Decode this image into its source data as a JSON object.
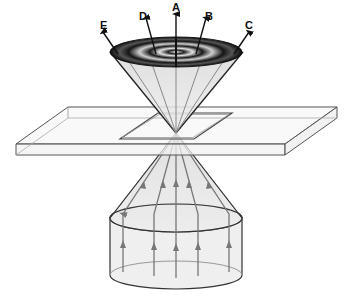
{
  "diagram": {
    "type": "microscope-conoscopy-illustration",
    "labels": {
      "A": "A",
      "B": "B",
      "C": "C",
      "D": "D",
      "E": "E"
    },
    "components": {
      "upper_cone": "diffraction / interference pattern cone",
      "slide": "glass slide with specimen",
      "lower_cone": "illuminating light cone",
      "cylinder": "parallel incident rays"
    },
    "colors": {
      "outline": "#333333",
      "ray": "#777777",
      "fill": "#e8e8e8",
      "pattern_dark": "#111111",
      "pattern_light": "#dcdcdc"
    }
  }
}
